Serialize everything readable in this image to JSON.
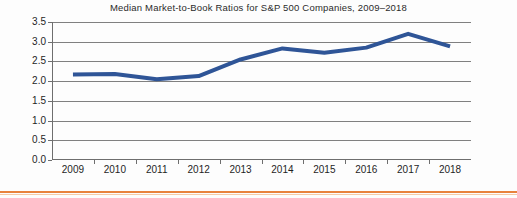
{
  "chart_data": {
    "type": "line",
    "title": "Median Market-to-Book Ratios for S&P 500 Companies, 2009–2018",
    "xlabel": "",
    "ylabel": "",
    "categories": [
      "2009",
      "2010",
      "2011",
      "2012",
      "2013",
      "2014",
      "2015",
      "2016",
      "2017",
      "2018"
    ],
    "values": [
      2.17,
      2.18,
      2.05,
      2.13,
      2.55,
      2.83,
      2.72,
      2.85,
      3.2,
      2.88
    ],
    "series": [
      {
        "name": "Median Market-to-Book Ratio",
        "values": [
          2.17,
          2.18,
          2.05,
          2.13,
          2.55,
          2.83,
          2.72,
          2.85,
          3.2,
          2.88
        ],
        "color": "#2f5597"
      }
    ],
    "ylim": [
      0.0,
      3.5
    ],
    "ytick_labels": [
      "0.0",
      "0.5",
      "1.0",
      "1.5",
      "2.0",
      "2.5",
      "3.0",
      "3.5"
    ],
    "ytick_values": [
      0.0,
      0.5,
      1.0,
      1.5,
      2.0,
      2.5,
      3.0,
      3.5
    ],
    "grid": "horizontal",
    "legend": "none",
    "line_width_px": 4,
    "colors": {
      "line": "#2f5597",
      "gridline": "#808080",
      "axis": "#6e6e6e",
      "title_text": "#2b2b2b",
      "tick_text": "#1f1f1f",
      "accent_rule": "#e8823c"
    }
  },
  "footer": {
    "rule_color": "#e8823c"
  }
}
